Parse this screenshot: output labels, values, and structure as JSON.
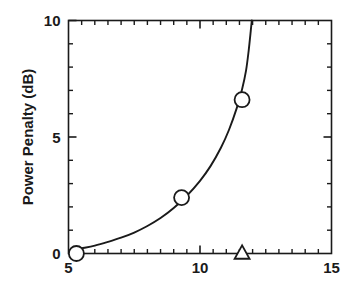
{
  "chart_data": {
    "type": "scatter",
    "title": "",
    "xlabel": "",
    "ylabel": "Power Penalty (dB)",
    "xlim": [
      5,
      15
    ],
    "ylim": [
      0,
      10
    ],
    "grid": false,
    "legend": "none",
    "x_major_ticks": [
      5,
      10,
      15
    ],
    "x_major_tick_labels": [
      "5",
      "10",
      "15"
    ],
    "x_minor_tick_step": 0.5,
    "y_major_ticks": [
      0,
      5,
      10
    ],
    "y_major_tick_labels": [
      "0",
      "5",
      "10"
    ],
    "y_minor_tick_step": 1,
    "tick_direction": "in",
    "frame": "box",
    "series": [
      {
        "name": "measured",
        "marker": "circle-open",
        "points": [
          {
            "x": 5.3,
            "y": 0.0
          },
          {
            "x": 9.3,
            "y": 2.4
          },
          {
            "x": 11.6,
            "y": 6.6
          }
        ]
      },
      {
        "name": "reference",
        "marker": "triangle-open",
        "points": [
          {
            "x": 11.6,
            "y": 0.0
          }
        ]
      },
      {
        "name": "model-curve",
        "marker": "none",
        "style": "solid-line",
        "points": [
          {
            "x": 5.05,
            "y": 0.12
          },
          {
            "x": 5.5,
            "y": 0.22
          },
          {
            "x": 6.0,
            "y": 0.34
          },
          {
            "x": 6.5,
            "y": 0.5
          },
          {
            "x": 7.0,
            "y": 0.68
          },
          {
            "x": 7.5,
            "y": 0.9
          },
          {
            "x": 8.0,
            "y": 1.18
          },
          {
            "x": 8.5,
            "y": 1.52
          },
          {
            "x": 9.0,
            "y": 1.95
          },
          {
            "x": 9.5,
            "y": 2.48
          },
          {
            "x": 10.0,
            "y": 3.12
          },
          {
            "x": 10.4,
            "y": 3.75
          },
          {
            "x": 10.8,
            "y": 4.55
          },
          {
            "x": 11.1,
            "y": 5.3
          },
          {
            "x": 11.4,
            "y": 6.25
          },
          {
            "x": 11.6,
            "y": 7.05
          },
          {
            "x": 11.75,
            "y": 7.85
          },
          {
            "x": 11.85,
            "y": 8.7
          },
          {
            "x": 11.92,
            "y": 9.45
          },
          {
            "x": 11.97,
            "y": 10.0
          }
        ]
      }
    ]
  }
}
